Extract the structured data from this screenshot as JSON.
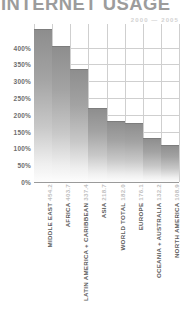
{
  "chart_data": {
    "type": "bar",
    "title": "INTERNET USAGE",
    "subtitle": "2000 — 2005",
    "xlabel": "",
    "ylabel": "",
    "ylim": [
      0,
      470
    ],
    "grid": true,
    "legend": "none",
    "yticks": [
      "0%",
      "50%",
      "100%",
      "150%",
      "200%",
      "250%",
      "300%",
      "350%",
      "400%"
    ],
    "ytick_values": [
      0,
      50,
      100,
      150,
      200,
      250,
      300,
      350,
      400
    ],
    "categories": [
      "MIDDLE EAST",
      "AFRICA",
      "LATIN AMERICA + CARIBBEAN",
      "ASIA",
      "WORLD TOTAL",
      "EUROPE",
      "OCEANIA + AUSTRALIA",
      "NORTH AMERICA"
    ],
    "values": [
      454.2,
      403.7,
      337.4,
      218.7,
      182.0,
      176.1,
      132.2,
      108.9
    ],
    "value_labels": [
      "454.2",
      "403.7",
      "337.4",
      "218.7",
      "182.0",
      "176.1",
      "132.2",
      "108.9"
    ],
    "bar_color_top": "#8d8d8d",
    "bar_color_bottom": "#fdfdfd",
    "grid_color": "#cfcfcf",
    "axis_color": "#9a9a9a",
    "title_color": "#9c9c9c",
    "subtitle_color": "#d2d2d2",
    "ytick_color": "#6e6e6e",
    "category_color": "#5c5c5c",
    "value_color": "#c0c0c0"
  }
}
